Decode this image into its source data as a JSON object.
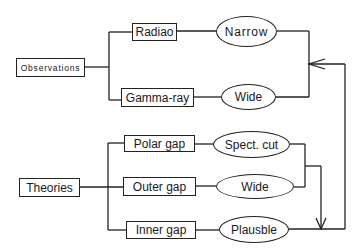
{
  "diagram": {
    "root_nodes": {
      "observations": "Observations",
      "theories": "Theories"
    },
    "observations": [
      {
        "source": "Radiao",
        "result": "Narrow"
      },
      {
        "source": "Gamma-ray",
        "result": "Wide"
      }
    ],
    "theories": [
      {
        "model": "Polar gap",
        "result": "Spect. cut"
      },
      {
        "model": "Outer gap",
        "result": "Wide"
      },
      {
        "model": "Inner gap",
        "result": "Plausble"
      }
    ],
    "colors": {
      "line": "#222222",
      "background": "#ffffff"
    }
  }
}
